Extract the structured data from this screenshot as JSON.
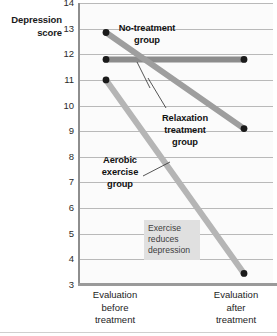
{
  "chart_data": {
    "type": "line",
    "title": "",
    "ylabel": "Depression score",
    "xlabel": "",
    "ylim": [
      3,
      14
    ],
    "grid": true,
    "legend_position": "inline-annotations",
    "categories": [
      "Evaluation before treatment",
      "Evaluation after treatment"
    ],
    "x_tick_labels": [
      [
        "Evaluation",
        "before",
        "treatment"
      ],
      [
        "Evaluation",
        "after",
        "treatment"
      ]
    ],
    "y_tick_labels": [
      "14",
      "13",
      "12",
      "11",
      "10",
      "9",
      "8",
      "7",
      "6",
      "5",
      "4",
      "3"
    ],
    "y_ticks": [
      14,
      13,
      12,
      11,
      10,
      9,
      8,
      7,
      6,
      5,
      4,
      3
    ],
    "series": [
      {
        "name": "No-treatment group",
        "label_lines": [
          "No-treatment",
          "group"
        ],
        "values": [
          11.8,
          11.8
        ],
        "color": "#8c8c8c"
      },
      {
        "name": "Relaxation treatment group",
        "label_lines": [
          "Relaxation",
          "treatment",
          "group"
        ],
        "values": [
          12.85,
          9.1
        ],
        "color": "#9e9e9e"
      },
      {
        "name": "Aerobic exercise group",
        "label_lines": [
          "Aerobic",
          "exercise",
          "group"
        ],
        "values": [
          11.0,
          3.45
        ],
        "color": "#b5b5b5"
      }
    ],
    "annotations": [
      {
        "text": "Exercise reduces depression",
        "lines": [
          "Exercise",
          "reduces",
          "depression"
        ],
        "style": "caption-box"
      }
    ],
    "marker_color": "#1a1a1a",
    "gridline_color": "#b9b9b9",
    "axis_color": "#9a9a9a",
    "plot_background": "#fbfbfb",
    "caption_background": "#e0e0e0"
  }
}
